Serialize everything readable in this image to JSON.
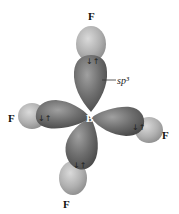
{
  "diagram": {
    "central_atom": "B",
    "ligands": [
      {
        "label": "F",
        "position": "top"
      },
      {
        "label": "F",
        "position": "left"
      },
      {
        "label": "F",
        "position": "right"
      },
      {
        "label": "F",
        "position": "bottom"
      }
    ],
    "orbital_label": "sp³",
    "electron_pair_symbol": "↓↑",
    "colors": {
      "hybrid_lobe": "#6b6b6b",
      "hybrid_lobe_highlight": "#9a9a9a",
      "fluorine_orbital": "#b0b0b0",
      "fluorine_highlight": "#d6d6d6",
      "background": "#ffffff"
    }
  }
}
